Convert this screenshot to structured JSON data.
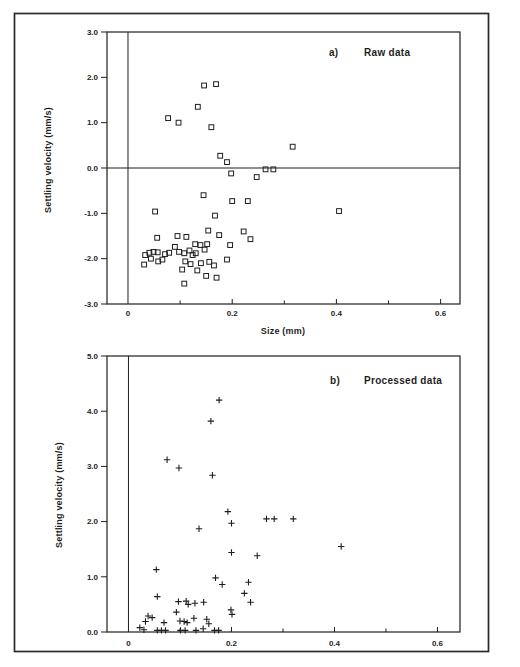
{
  "figure": {
    "background_color": "#ffffff",
    "ink_color": "#1f1f1f",
    "border_color": "#2a2a2a"
  },
  "chart_data": [
    {
      "type": "scatter",
      "panel_label": "a)",
      "title": "Raw data",
      "xlabel": "Size (mm)",
      "ylabel": "Settling velocity (mm/s)",
      "marker": "square",
      "xlim": [
        -0.0403,
        0.6372
      ],
      "ylim": [
        -3.0,
        3.0
      ],
      "x_ticks": [
        0.2,
        0.4,
        0.6
      ],
      "x_minor_ticks": [
        0.1,
        0.3,
        0.5
      ],
      "x_tick_labels": [
        {
          "value": 0,
          "label": "0"
        },
        {
          "value": 0.2,
          "label": "0.2"
        },
        {
          "value": 0.4,
          "label": "0.4"
        },
        {
          "value": 0.6,
          "label": "0.6"
        }
      ],
      "y_ticks": [
        {
          "value": 3.0,
          "label": "3.0"
        },
        {
          "value": 2.0,
          "label": "2.0"
        },
        {
          "value": 1.0,
          "label": "1.0"
        },
        {
          "value": 0.0,
          "label": "0.0"
        },
        {
          "value": -1.0,
          "label": "-1.0"
        },
        {
          "value": -2.0,
          "label": "-2.0"
        },
        {
          "value": -3.0,
          "label": "-3.0"
        }
      ],
      "zero_line_horizontal": true,
      "zero_line_vertical": true,
      "grid": false,
      "legend": null,
      "points": [
        [
          0.146,
          1.82
        ],
        [
          0.169,
          1.85
        ],
        [
          0.134,
          1.35
        ],
        [
          0.077,
          1.1
        ],
        [
          0.097,
          1.0
        ],
        [
          0.16,
          0.9
        ],
        [
          0.316,
          0.47
        ],
        [
          0.177,
          0.27
        ],
        [
          0.19,
          0.13
        ],
        [
          0.264,
          -0.03
        ],
        [
          0.279,
          -0.03
        ],
        [
          0.198,
          -0.12
        ],
        [
          0.247,
          -0.2
        ],
        [
          0.145,
          -0.6
        ],
        [
          0.2,
          -0.73
        ],
        [
          0.23,
          -0.73
        ],
        [
          0.052,
          -0.96
        ],
        [
          0.167,
          -1.05
        ],
        [
          0.405,
          -0.95
        ],
        [
          0.154,
          -1.38
        ],
        [
          0.222,
          -1.4
        ],
        [
          0.056,
          -1.54
        ],
        [
          0.095,
          -1.5
        ],
        [
          0.112,
          -1.52
        ],
        [
          0.175,
          -1.48
        ],
        [
          0.235,
          -1.57
        ],
        [
          0.09,
          -1.74
        ],
        [
          0.129,
          -1.68
        ],
        [
          0.139,
          -1.7
        ],
        [
          0.152,
          -1.68
        ],
        [
          0.196,
          -1.7
        ],
        [
          0.033,
          -1.92
        ],
        [
          0.041,
          -1.87
        ],
        [
          0.049,
          -1.85
        ],
        [
          0.057,
          -1.86
        ],
        [
          0.071,
          -1.9
        ],
        [
          0.079,
          -1.87
        ],
        [
          0.044,
          -2.0
        ],
        [
          0.058,
          -2.06
        ],
        [
          0.066,
          -2.02
        ],
        [
          0.031,
          -2.13
        ],
        [
          0.098,
          -1.85
        ],
        [
          0.108,
          -1.88
        ],
        [
          0.118,
          -1.82
        ],
        [
          0.124,
          -1.92
        ],
        [
          0.13,
          -1.88
        ],
        [
          0.147,
          -1.8
        ],
        [
          0.11,
          -2.06
        ],
        [
          0.12,
          -2.12
        ],
        [
          0.104,
          -2.24
        ],
        [
          0.133,
          -2.26
        ],
        [
          0.14,
          -2.1
        ],
        [
          0.156,
          -2.07
        ],
        [
          0.165,
          -2.15
        ],
        [
          0.19,
          -2.02
        ],
        [
          0.15,
          -2.38
        ],
        [
          0.17,
          -2.42
        ],
        [
          0.108,
          -2.55
        ]
      ]
    },
    {
      "type": "scatter",
      "panel_label": "b)",
      "title": "Processed data",
      "xlabel": "",
      "ylabel": "Settling velocity (mm/s)",
      "marker": "plus",
      "xlim": [
        -0.0417,
        0.6437
      ],
      "ylim": [
        0.0,
        5.0
      ],
      "x_ticks": [
        0.2,
        0.4,
        0.6
      ],
      "x_minor_ticks": [
        0.1,
        0.3,
        0.5
      ],
      "x_tick_labels": [
        {
          "value": 0,
          "label": "0"
        },
        {
          "value": 0.2,
          "label": "0.2"
        },
        {
          "value": 0.4,
          "label": "0.4"
        },
        {
          "value": 0.6,
          "label": "0.6"
        }
      ],
      "y_ticks": [
        {
          "value": 5.0,
          "label": "5.0"
        },
        {
          "value": 4.0,
          "label": "4.0"
        },
        {
          "value": 3.0,
          "label": "3.0"
        },
        {
          "value": 2.0,
          "label": "2.0"
        },
        {
          "value": 1.0,
          "label": "1.0"
        },
        {
          "value": 0.0,
          "label": "0.0"
        }
      ],
      "zero_line_horizontal": false,
      "zero_line_vertical": true,
      "grid": false,
      "legend": null,
      "points": [
        [
          0.176,
          4.2
        ],
        [
          0.16,
          3.82
        ],
        [
          0.075,
          3.12
        ],
        [
          0.098,
          2.97
        ],
        [
          0.163,
          2.84
        ],
        [
          0.193,
          2.18
        ],
        [
          0.2,
          1.97
        ],
        [
          0.137,
          1.87
        ],
        [
          0.268,
          2.05
        ],
        [
          0.283,
          2.05
        ],
        [
          0.32,
          2.05
        ],
        [
          0.2,
          1.44
        ],
        [
          0.25,
          1.38
        ],
        [
          0.413,
          1.55
        ],
        [
          0.054,
          1.13
        ],
        [
          0.169,
          0.98
        ],
        [
          0.182,
          0.86
        ],
        [
          0.233,
          0.9
        ],
        [
          0.225,
          0.7
        ],
        [
          0.056,
          0.64
        ],
        [
          0.237,
          0.54
        ],
        [
          0.097,
          0.55
        ],
        [
          0.112,
          0.56
        ],
        [
          0.116,
          0.5
        ],
        [
          0.129,
          0.52
        ],
        [
          0.146,
          0.54
        ],
        [
          0.093,
          0.36
        ],
        [
          0.199,
          0.4
        ],
        [
          0.201,
          0.32
        ],
        [
          0.038,
          0.29
        ],
        [
          0.046,
          0.26
        ],
        [
          0.069,
          0.17
        ],
        [
          0.1,
          0.2
        ],
        [
          0.108,
          0.19
        ],
        [
          0.114,
          0.17
        ],
        [
          0.127,
          0.25
        ],
        [
          0.152,
          0.23
        ],
        [
          0.156,
          0.15
        ],
        [
          0.033,
          0.19
        ],
        [
          0.022,
          0.08
        ],
        [
          0.03,
          0.04
        ],
        [
          0.056,
          0.03
        ],
        [
          0.064,
          0.03
        ],
        [
          0.072,
          0.03
        ],
        [
          0.101,
          0.03
        ],
        [
          0.11,
          0.03
        ],
        [
          0.131,
          0.03
        ],
        [
          0.145,
          0.06
        ],
        [
          0.167,
          0.03
        ],
        [
          0.175,
          0.03
        ]
      ]
    }
  ]
}
